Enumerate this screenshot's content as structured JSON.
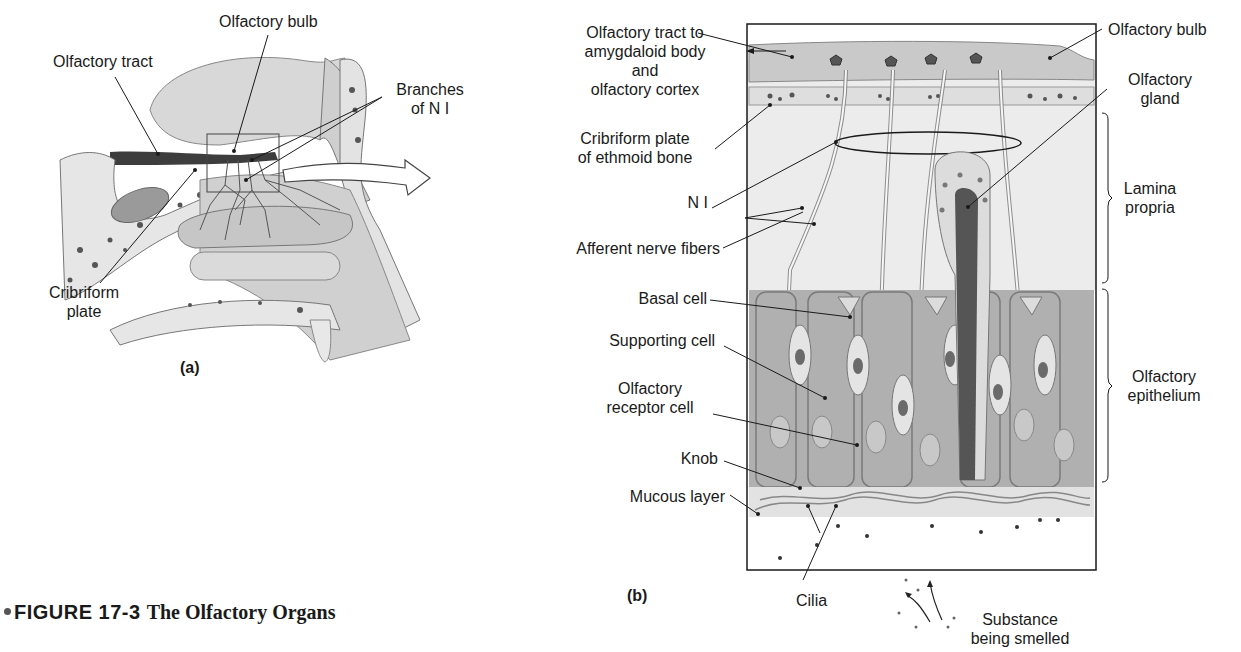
{
  "figure": {
    "number": "FIGURE 17-3",
    "title": "The Olfactory Organs"
  },
  "panel_a": {
    "letter": "(a)",
    "labels": {
      "olfactory_bulb": "Olfactory bulb",
      "olfactory_tract": "Olfactory tract",
      "branches_line1": "Branches",
      "branches_line2": "of N I",
      "cribriform_line1": "Cribriform",
      "cribriform_line2": "plate"
    }
  },
  "panel_b": {
    "letter": "(b)",
    "labels": {
      "tract_line1": "Olfactory tract to",
      "tract_line2": "amygdaloid body",
      "tract_line3": "and",
      "tract_line4": "olfactory cortex",
      "cribriform_line1": "Cribriform plate",
      "cribriform_line2": "of ethmoid bone",
      "n_i": "N I",
      "afferent": "Afferent nerve fibers",
      "basal_cell": "Basal cell",
      "supporting_cell": "Supporting cell",
      "receptor_line1": "Olfactory",
      "receptor_line2": "receptor cell",
      "knob": "Knob",
      "mucous_layer": "Mucous layer",
      "cilia": "Cilia",
      "substance_line1": "Substance",
      "substance_line2": "being smelled",
      "olfactory_bulb": "Olfactory bulb",
      "gland_line1": "Olfactory",
      "gland_line2": "gland",
      "lamina_line1": "Lamina",
      "lamina_line2": "propria",
      "epithelium_line1": "Olfactory",
      "epithelium_line2": "epithelium"
    }
  },
  "colors": {
    "tissue_light": "#e6e6e6",
    "epithelium": "#a9a9a9",
    "dark": "#4a4a4a",
    "line": "#1a1a1a"
  }
}
